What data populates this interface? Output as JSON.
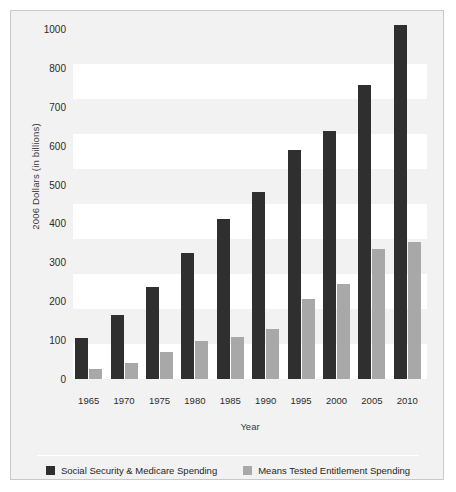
{
  "chart_data": {
    "type": "bar",
    "title": "",
    "xlabel": "Year",
    "ylabel": "2006 Dollars (in billions)",
    "categories": [
      "1965",
      "1970",
      "1975",
      "1980",
      "1985",
      "1990",
      "1995",
      "2000",
      "2005",
      "2010"
    ],
    "series": [
      {
        "name": "Social Security & Medicare Spending",
        "color": "#2f2f2f",
        "values": [
          118,
          183,
          262,
          360,
          457,
          535,
          653,
          710,
          840,
          1012
        ]
      },
      {
        "name": "Means Tested Entitlement Spending",
        "color": "#a8a8a8",
        "values": [
          30,
          45,
          78,
          110,
          120,
          142,
          230,
          272,
          372,
          392
        ]
      }
    ],
    "ylim": [
      0,
      1000
    ],
    "ytick_labels": [
      "1000",
      "800",
      "700",
      "600",
      "500",
      "400",
      "300",
      "200",
      "100",
      "0"
    ],
    "ytick_values": [
      1000,
      900,
      800,
      700,
      600,
      500,
      400,
      300,
      200,
      100,
      0
    ],
    "grid": "alternating-horizontal-bands",
    "legend_position": "bottom-center"
  },
  "axes": {
    "y_title": "2006 Dollars (in billions)",
    "x_title": "Year"
  },
  "legend": {
    "items": [
      {
        "label": "Social Security & Medicare Spending",
        "color": "#2f2f2f"
      },
      {
        "label": "Means Tested Entitlement Spending",
        "color": "#a8a8a8"
      }
    ]
  },
  "colors": {
    "series0": "#2f2f2f",
    "series1": "#a8a8a8",
    "panel": "#f2f2f2",
    "band": "#ffffff",
    "border": "#c9c9c9"
  }
}
